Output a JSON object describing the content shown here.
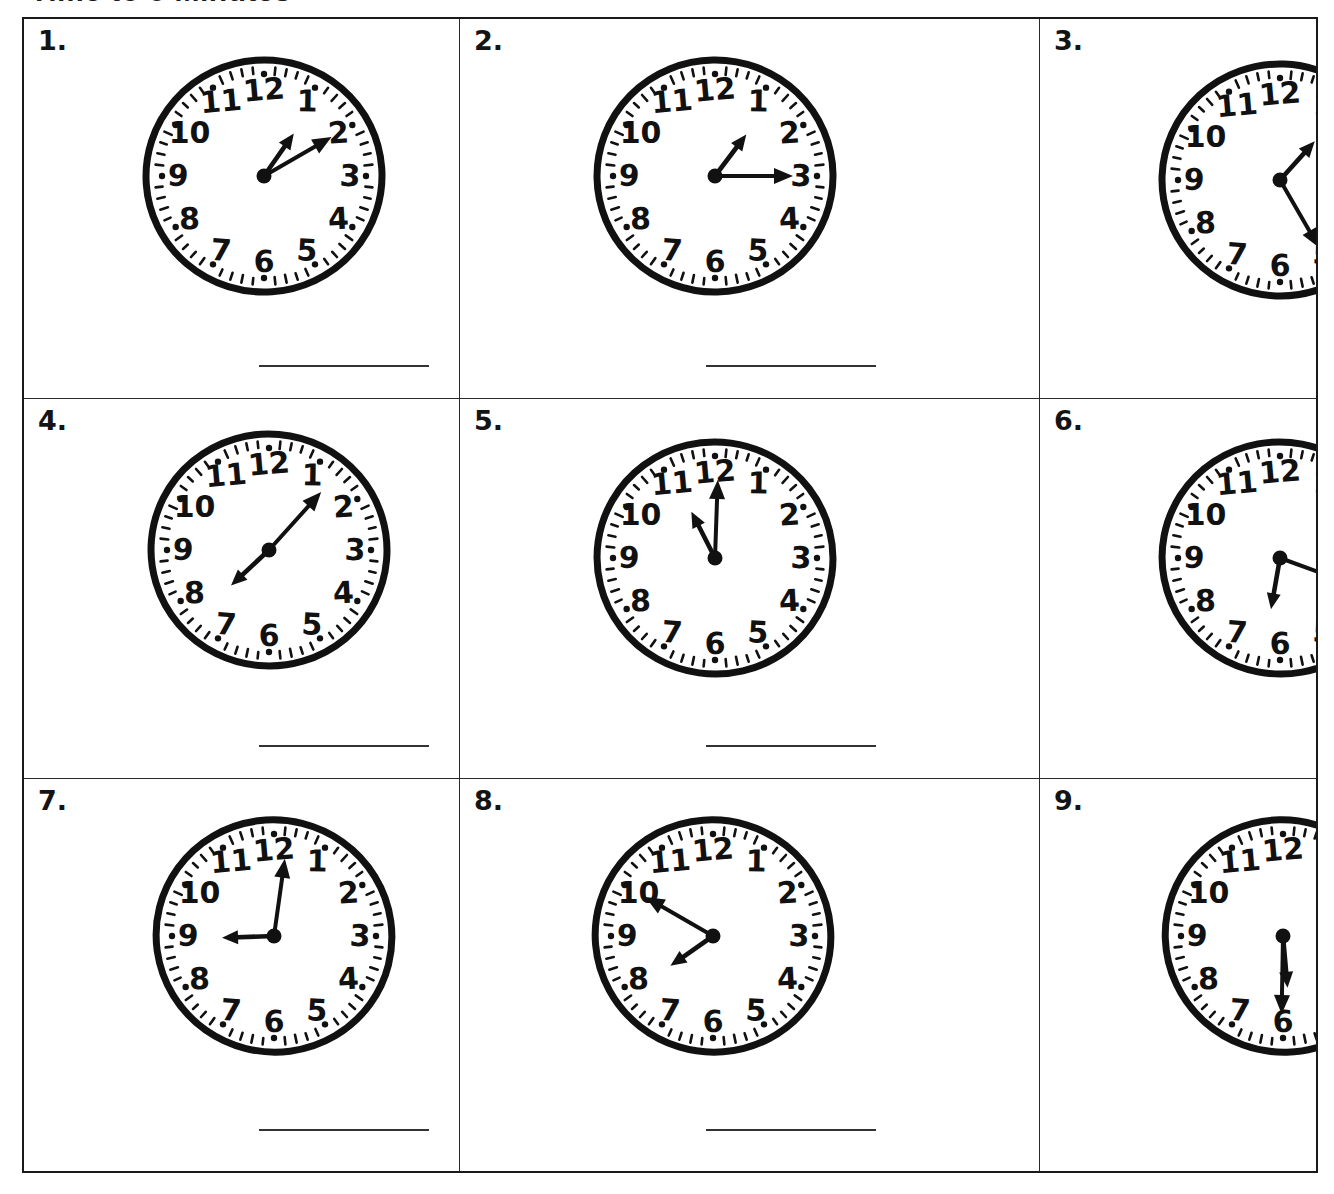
{
  "worksheet": {
    "title": "Time to 5 Minutes",
    "title_visible_fragment": "Time to 5 Minutes",
    "answer_line_label": ""
  },
  "grid": {
    "rows": 3,
    "columns": 3
  },
  "problems": [
    {
      "number": "1.",
      "hour_label": "1",
      "minute_label": "10",
      "time": "1:10",
      "hour_angle_deg": 35,
      "minute_angle_deg": 60,
      "answer": ""
    },
    {
      "number": "2.",
      "hour_label": "1",
      "minute_label": "15",
      "time": "1:15",
      "hour_angle_deg": 37,
      "minute_angle_deg": 90,
      "answer": ""
    },
    {
      "number": "3.",
      "hour_label": "1",
      "minute_label": "25",
      "time": "1:25",
      "hour_angle_deg": 42,
      "minute_angle_deg": 150,
      "answer": ""
    },
    {
      "number": "4.",
      "hour_label": "7",
      "minute_label": "35",
      "time": "7:35",
      "hour_angle_deg": 227,
      "minute_angle_deg": 42,
      "answer": ""
    },
    {
      "number": "5.",
      "hour_label": "11",
      "minute_label": "00",
      "time": "11:00",
      "hour_angle_deg": 333,
      "minute_angle_deg": 2,
      "answer": ""
    },
    {
      "number": "6.",
      "hour_label": "6",
      "minute_label": "20",
      "time": "6:20",
      "hour_angle_deg": 190,
      "minute_angle_deg": 110,
      "answer": ""
    },
    {
      "number": "7.",
      "hour_label": "9",
      "minute_label": "00",
      "time": "9:00",
      "hour_angle_deg": 268,
      "minute_angle_deg": 8,
      "answer": ""
    },
    {
      "number": "8.",
      "hour_label": "7",
      "minute_label": "50",
      "time": "7:50",
      "hour_angle_deg": 235,
      "minute_angle_deg": 300,
      "answer": ""
    },
    {
      "number": "9.",
      "hour_label": "5",
      "minute_label": "30",
      "time": "5:30",
      "hour_angle_deg": 175,
      "minute_angle_deg": 181,
      "answer": ""
    }
  ],
  "clock_face": {
    "numerals": [
      "12",
      "1",
      "2",
      "3",
      "4",
      "5",
      "6",
      "7",
      "8",
      "9",
      "10",
      "11"
    ],
    "tick_count": 60,
    "major_tick_count": 12,
    "stroke_color": "#111111",
    "face_color": "#ffffff"
  }
}
